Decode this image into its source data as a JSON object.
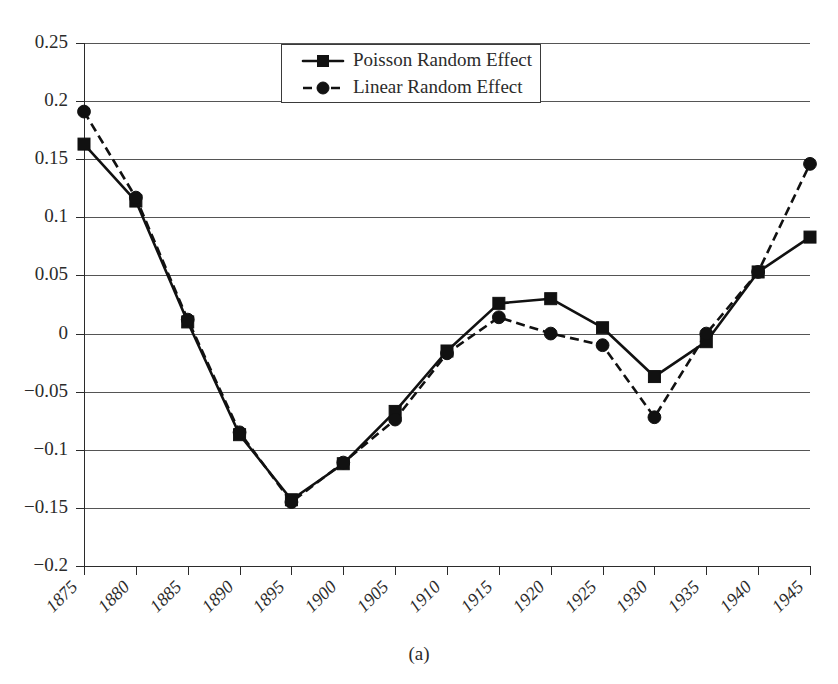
{
  "figure": {
    "caption": "(a)"
  },
  "chart_data": {
    "type": "line",
    "title": "",
    "xlabel": "",
    "ylabel": "",
    "categories": [
      "1875",
      "1880",
      "1885",
      "1890",
      "1895",
      "1900",
      "1905",
      "1910",
      "1915",
      "1920",
      "1925",
      "1930",
      "1935",
      "1940",
      "1945"
    ],
    "ytick_labels": [
      "0.25",
      "0.2",
      "0.15",
      "0.1",
      "0.05",
      "0",
      "-0.05",
      "-0.1",
      "-0.15",
      "-0.2"
    ],
    "ytick_values": [
      0.25,
      0.2,
      0.15,
      0.1,
      0.05,
      0,
      -0.05,
      -0.1,
      -0.15,
      -0.2
    ],
    "ylim": [
      -0.2,
      0.25
    ],
    "grid": "horizontal",
    "legend_position": "top-center",
    "series": [
      {
        "name": "Poisson Random Effect",
        "marker": "square",
        "linestyle": "solid",
        "color": "#111111",
        "values": [
          0.163,
          0.114,
          0.01,
          -0.087,
          -0.143,
          -0.112,
          -0.067,
          -0.015,
          0.026,
          0.03,
          0.005,
          -0.037,
          -0.007,
          0.053,
          0.083
        ]
      },
      {
        "name": "Linear Random Effect",
        "marker": "circle",
        "linestyle": "dashed",
        "color": "#111111",
        "values": [
          0.191,
          0.117,
          0.012,
          -0.085,
          -0.145,
          -0.111,
          -0.074,
          -0.017,
          0.014,
          0.0,
          -0.01,
          -0.072,
          0.0,
          0.053,
          0.146
        ]
      }
    ]
  }
}
